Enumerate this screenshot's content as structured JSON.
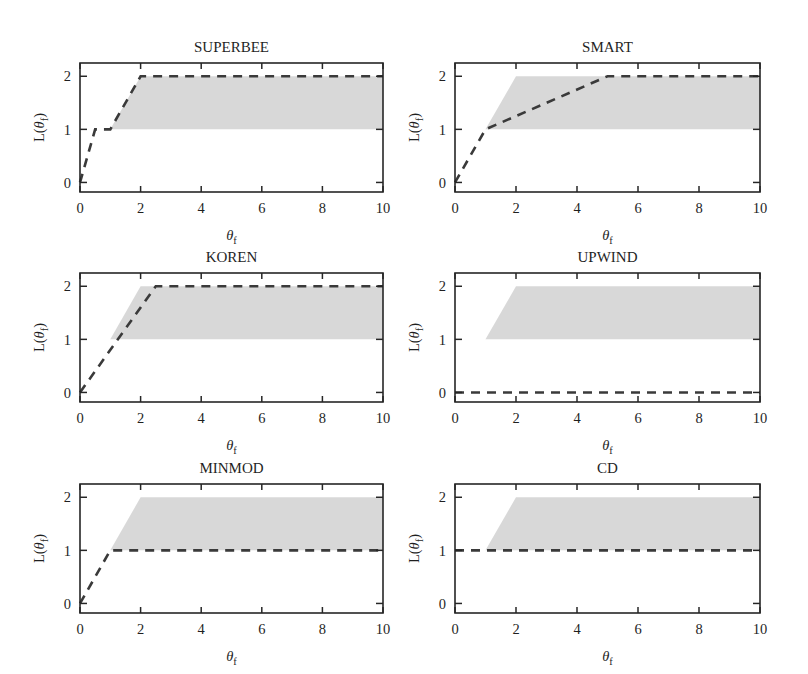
{
  "figure": {
    "width": 808,
    "height": 674,
    "background": "#ffffff",
    "line_color": "#3a3a3a",
    "band_color": "#c9c9c9",
    "axis_color": "#262626"
  },
  "chart_data": [
    {
      "type": "line",
      "title": "SUPERBEE",
      "xlabel": "θ",
      "xlabel_sub": "f",
      "ylabel": "L(θ",
      "ylabel_sub": "f",
      "ylabel_tail": ")",
      "xlim": [
        0,
        10
      ],
      "ylim": [
        -0.18,
        2.25
      ],
      "xticks": [
        0,
        2,
        4,
        6,
        8,
        10
      ],
      "xticklabels": [
        "0",
        "2",
        "4",
        "6",
        "8",
        "10"
      ],
      "yticks": [
        0,
        1,
        2
      ],
      "yticklabels": [
        "0",
        "1",
        "2"
      ],
      "grid": false,
      "legend": "none",
      "series": [
        {
          "name": "limiter",
          "style": "dashed",
          "x": [
            0,
            0.5,
            1,
            2,
            10
          ],
          "y": [
            0,
            1,
            1,
            2,
            2
          ]
        }
      ],
      "band": {
        "name": "TVD region",
        "x": [
          0,
          1,
          2,
          10
        ],
        "y_lower": [
          0,
          1,
          1,
          1
        ],
        "y_upper": [
          0,
          1,
          2,
          2
        ]
      }
    },
    {
      "type": "line",
      "title": "SMART",
      "xlabel": "θ",
      "xlabel_sub": "f",
      "ylabel": "L(θ",
      "ylabel_sub": "f",
      "ylabel_tail": ")",
      "xlim": [
        0,
        10
      ],
      "ylim": [
        -0.18,
        2.25
      ],
      "xticks": [
        0,
        2,
        4,
        6,
        8,
        10
      ],
      "xticklabels": [
        "0",
        "2",
        "4",
        "6",
        "8",
        "10"
      ],
      "yticks": [
        0,
        1,
        2
      ],
      "yticklabels": [
        "0",
        "1",
        "2"
      ],
      "grid": false,
      "legend": "none",
      "series": [
        {
          "name": "limiter",
          "style": "dashed",
          "x": [
            0,
            1,
            5,
            10
          ],
          "y": [
            0,
            1,
            2,
            2
          ]
        }
      ],
      "band": {
        "name": "TVD region",
        "x": [
          0,
          1,
          2,
          10
        ],
        "y_lower": [
          0,
          1,
          1,
          1
        ],
        "y_upper": [
          0,
          1,
          2,
          2
        ]
      }
    },
    {
      "type": "line",
      "title": "KOREN",
      "xlabel": "θ",
      "xlabel_sub": "f",
      "ylabel": "L(θ",
      "ylabel_sub": "f",
      "ylabel_tail": ")",
      "xlim": [
        0,
        10
      ],
      "ylim": [
        -0.18,
        2.25
      ],
      "xticks": [
        0,
        2,
        4,
        6,
        8,
        10
      ],
      "xticklabels": [
        "0",
        "2",
        "4",
        "6",
        "8",
        "10"
      ],
      "yticks": [
        0,
        1,
        2
      ],
      "yticklabels": [
        "0",
        "1",
        "2"
      ],
      "grid": false,
      "legend": "none",
      "series": [
        {
          "name": "limiter",
          "style": "dashed",
          "x": [
            0,
            2.5,
            10
          ],
          "y": [
            0,
            2,
            2
          ]
        }
      ],
      "band": {
        "name": "TVD region",
        "x": [
          0,
          1,
          2,
          10
        ],
        "y_lower": [
          0,
          1,
          1,
          1
        ],
        "y_upper": [
          0,
          1,
          2,
          2
        ]
      }
    },
    {
      "type": "line",
      "title": "UPWIND",
      "xlabel": "θ",
      "xlabel_sub": "f",
      "ylabel": "L(θ",
      "ylabel_sub": "f",
      "ylabel_tail": ")",
      "xlim": [
        0,
        10
      ],
      "ylim": [
        -0.18,
        2.25
      ],
      "xticks": [
        0,
        2,
        4,
        6,
        8,
        10
      ],
      "xticklabels": [
        "0",
        "2",
        "4",
        "6",
        "8",
        "10"
      ],
      "yticks": [
        0,
        1,
        2
      ],
      "yticklabels": [
        "0",
        "1",
        "2"
      ],
      "grid": false,
      "legend": "none",
      "series": [
        {
          "name": "limiter",
          "style": "dashed",
          "x": [
            0,
            10
          ],
          "y": [
            0,
            0
          ]
        }
      ],
      "band": {
        "name": "TVD region",
        "x": [
          0,
          1,
          2,
          10
        ],
        "y_lower": [
          0,
          1,
          1,
          1
        ],
        "y_upper": [
          0,
          1,
          2,
          2
        ]
      }
    },
    {
      "type": "line",
      "title": "MINMOD",
      "xlabel": "θ",
      "xlabel_sub": "f",
      "ylabel": "L(θ",
      "ylabel_sub": "f",
      "ylabel_tail": ")",
      "xlim": [
        0,
        10
      ],
      "ylim": [
        -0.18,
        2.25
      ],
      "xticks": [
        0,
        2,
        4,
        6,
        8,
        10
      ],
      "xticklabels": [
        "0",
        "2",
        "4",
        "6",
        "8",
        "10"
      ],
      "yticks": [
        0,
        1,
        2
      ],
      "yticklabels": [
        "0",
        "1",
        "2"
      ],
      "grid": false,
      "legend": "none",
      "series": [
        {
          "name": "limiter",
          "style": "dashed",
          "x": [
            0,
            1,
            10
          ],
          "y": [
            0,
            1,
            1
          ]
        }
      ],
      "band": {
        "name": "TVD region",
        "x": [
          0,
          1,
          2,
          10
        ],
        "y_lower": [
          0,
          1,
          1,
          1
        ],
        "y_upper": [
          0,
          1,
          2,
          2
        ]
      }
    },
    {
      "type": "line",
      "title": "CD",
      "xlabel": "θ",
      "xlabel_sub": "f",
      "ylabel": "L(θ",
      "ylabel_sub": "f",
      "ylabel_tail": ")",
      "xlim": [
        0,
        10
      ],
      "ylim": [
        -0.18,
        2.25
      ],
      "xticks": [
        0,
        2,
        4,
        6,
        8,
        10
      ],
      "xticklabels": [
        "0",
        "2",
        "4",
        "6",
        "8",
        "10"
      ],
      "yticks": [
        0,
        1,
        2
      ],
      "yticklabels": [
        "0",
        "1",
        "2"
      ],
      "grid": false,
      "legend": "none",
      "series": [
        {
          "name": "limiter",
          "style": "dashed",
          "x": [
            0,
            10
          ],
          "y": [
            1,
            1
          ]
        }
      ],
      "band": {
        "name": "TVD region",
        "x": [
          0,
          1,
          2,
          10
        ],
        "y_lower": [
          0,
          1,
          1,
          1
        ],
        "y_upper": [
          0,
          1,
          2,
          2
        ]
      }
    }
  ],
  "panel_geometry": [
    {
      "left": 80,
      "top": 63,
      "width": 303,
      "height": 129
    },
    {
      "left": 455,
      "top": 63,
      "width": 305,
      "height": 129
    },
    {
      "left": 80,
      "top": 273,
      "width": 303,
      "height": 129
    },
    {
      "left": 455,
      "top": 273,
      "width": 305,
      "height": 129
    },
    {
      "left": 80,
      "top": 484,
      "width": 303,
      "height": 129
    },
    {
      "left": 455,
      "top": 484,
      "width": 305,
      "height": 129
    }
  ]
}
